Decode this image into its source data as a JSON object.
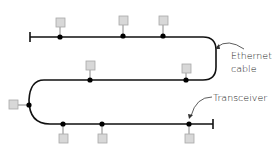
{
  "diagram": {
    "type": "ethernet-bus-topology",
    "labels": {
      "cable_line1": "Ethernet",
      "cable_line2": "cable",
      "transceiver": "Transceiver"
    },
    "colors": {
      "cable": "#111111",
      "transceiver_dot": "#000000",
      "station_fill": "#d8d8d8",
      "station_stroke": "#a8a8a8",
      "drop_line": "#888888",
      "label_text": "#222222",
      "arrow": "#333333"
    },
    "stations": [
      {
        "id": 1,
        "segment": "top",
        "side": "above"
      },
      {
        "id": 2,
        "segment": "top",
        "side": "above"
      },
      {
        "id": 3,
        "segment": "top",
        "side": "above"
      },
      {
        "id": 4,
        "segment": "middle",
        "side": "above"
      },
      {
        "id": 5,
        "segment": "middle",
        "side": "above"
      },
      {
        "id": 6,
        "segment": "left-curve",
        "side": "left"
      },
      {
        "id": 7,
        "segment": "bottom",
        "side": "below"
      },
      {
        "id": 8,
        "segment": "bottom",
        "side": "below"
      },
      {
        "id": 9,
        "segment": "bottom",
        "side": "below"
      }
    ],
    "terminators": 2
  }
}
